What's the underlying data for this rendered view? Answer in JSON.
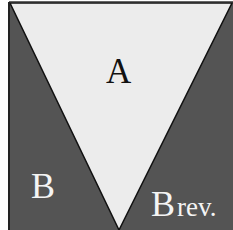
{
  "diagram": {
    "regions": [
      {
        "id": "A",
        "label": "A",
        "shape": "inverted-triangle",
        "fill": "#ececec"
      },
      {
        "id": "B",
        "label": "B",
        "shape": "left-triangle",
        "fill": "#545454"
      },
      {
        "id": "B_rev",
        "label_main": "B",
        "label_suffix": "rev.",
        "shape": "right-triangle",
        "fill": "#545454"
      }
    ],
    "colors": {
      "dark_region": "#545454",
      "light_region": "#ececec",
      "outline": "#111111",
      "dark_text": "#111111",
      "light_text": "#f4f4f4"
    }
  }
}
